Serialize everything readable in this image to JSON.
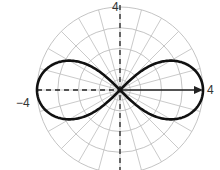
{
  "chart_data": {
    "type": "polar-line",
    "title": "",
    "equation_shape": "lemniscate r^2 = 16 cos(2θ)",
    "rmax": 4,
    "ring_values": [
      1,
      2,
      3,
      4
    ],
    "spoke_step_degrees": 15,
    "tick_labels": {
      "top": "4",
      "left": "−4",
      "right": "4"
    },
    "axes": {
      "horizontal": "dashed (left), arrow (right)",
      "vertical": "dashed"
    },
    "series": [
      {
        "name": "lemniscate",
        "a_squared": 16,
        "color": "#111111"
      }
    ],
    "grid": true
  },
  "colors": {
    "grid": "#bdbdbd",
    "curve": "#111111",
    "axis": "#222222"
  }
}
